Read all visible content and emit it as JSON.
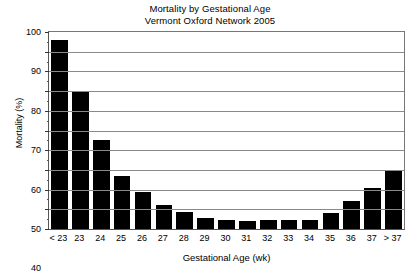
{
  "chart_data": {
    "type": "bar",
    "title": "Mortality by Gestational Age",
    "subtitle": "Vermont Oxford Network 2005",
    "xlabel": "Gestational Age (wk)",
    "ylabel": "Mortality (%)",
    "ylim": [
      0,
      100
    ],
    "ytick_step": 10,
    "yticks": [
      0,
      10,
      20,
      30,
      40,
      50,
      60,
      70,
      80,
      90,
      100
    ],
    "ytick_labels": [
      "0",
      "10",
      "20",
      "30",
      "40",
      "50",
      "60",
      "70",
      "80",
      "90",
      "100"
    ],
    "grid": "horizontal",
    "legend": "none",
    "bar_color": "#000000",
    "categories": [
      "< 23",
      "23",
      "24",
      "25",
      "26",
      "27",
      "28",
      "29",
      "30",
      "31",
      "32",
      "33",
      "34",
      "35",
      "36",
      "37",
      "> 37"
    ],
    "values": [
      96,
      70,
      45,
      27,
      19,
      12,
      8.5,
      5.5,
      4.5,
      4,
      4.5,
      4.5,
      4.5,
      8,
      14,
      21,
      30
    ],
    "series": [
      {
        "name": "Mortality (%)",
        "values": [
          96,
          70,
          45,
          27,
          19,
          12,
          8.5,
          5.5,
          4.5,
          4,
          4.5,
          4.5,
          4.5,
          8,
          14,
          21,
          30
        ]
      }
    ]
  }
}
